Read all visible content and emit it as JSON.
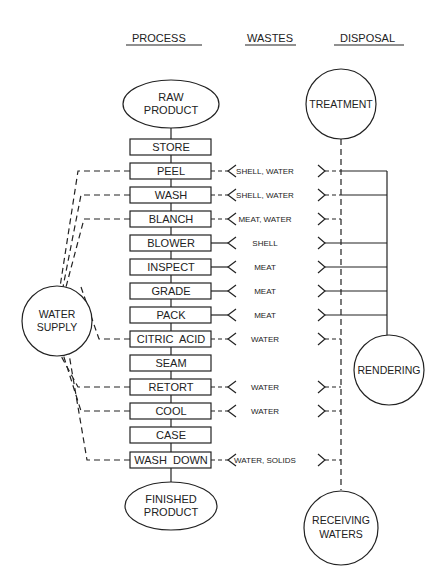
{
  "headers": {
    "process": "PROCESS",
    "wastes": "WASTES",
    "disposal": "DISPOSAL"
  },
  "start": {
    "line1": "RAW",
    "line2": "PRODUCT"
  },
  "end": {
    "line1": "FINISHED",
    "line2": "PRODUCT"
  },
  "water_supply": {
    "line1": "WATER",
    "line2": "SUPPLY"
  },
  "disposal": {
    "treatment": "TREATMENT",
    "rendering": "RENDERING",
    "receiving_line1": "RECEIVING",
    "receiving_line2": "WATERS"
  },
  "steps": [
    {
      "label": "STORE",
      "waste": "",
      "water_in": false,
      "waste_to": "none"
    },
    {
      "label": "PEEL",
      "waste": "SHELL, WATER",
      "water_in": true,
      "waste_to": "both"
    },
    {
      "label": "WASH",
      "waste": "SHELL, WATER",
      "water_in": true,
      "waste_to": "both"
    },
    {
      "label": "BLANCH",
      "waste": "MEAT, WATER",
      "water_in": true,
      "waste_to": "treatment"
    },
    {
      "label": "BLOWER",
      "waste": "SHELL",
      "water_in": false,
      "waste_to": "rendering"
    },
    {
      "label": "INSPECT",
      "waste": "MEAT",
      "water_in": false,
      "waste_to": "rendering"
    },
    {
      "label": "GRADE",
      "waste": "MEAT",
      "water_in": false,
      "waste_to": "rendering"
    },
    {
      "label": "PACK",
      "waste": "MEAT",
      "water_in": false,
      "waste_to": "rendering"
    },
    {
      "label": "CITRIC  ACID",
      "waste": "WATER",
      "water_in": true,
      "waste_to": "treatment"
    },
    {
      "label": "SEAM",
      "waste": "",
      "water_in": false,
      "waste_to": "none"
    },
    {
      "label": "RETORT",
      "waste": "WATER",
      "water_in": true,
      "waste_to": "treatment"
    },
    {
      "label": "COOL",
      "waste": "WATER",
      "water_in": true,
      "waste_to": "treatment"
    },
    {
      "label": "CASE",
      "waste": "",
      "water_in": false,
      "waste_to": "none"
    },
    {
      "label": "WASH  DOWN",
      "waste": "WATER, SOLIDS",
      "water_in": true,
      "waste_to": "treatment"
    }
  ],
  "colors": {
    "ink": "#222222",
    "background": "#ffffff"
  }
}
